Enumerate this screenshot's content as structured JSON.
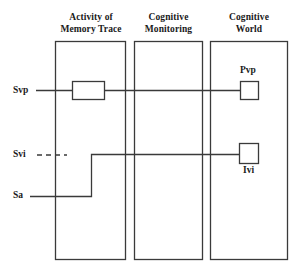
{
  "figure": {
    "background_color": "#ffffff",
    "stroke_color": "#3a3a3a",
    "text_color": "#1a1a1a"
  },
  "columns": [
    {
      "id": "activity-of-memory-trace",
      "title_line1": "Activity of",
      "title_line2": "Memory Trace"
    },
    {
      "id": "cognitive-monitoring",
      "title_line1": "Cognitive",
      "title_line2": "Monitoring"
    },
    {
      "id": "cognitive-world",
      "title_line1": "Cognitive",
      "title_line2": "World"
    }
  ],
  "signals": [
    {
      "id": "svp",
      "label": "Svp",
      "style": "solid"
    },
    {
      "id": "svi",
      "label": "Svi",
      "style": "dashed"
    },
    {
      "id": "sa",
      "label": "Sa",
      "style": "solid"
    }
  ],
  "nodes": [
    {
      "id": "memory-trace-box",
      "label": "",
      "shape": "rectangle"
    },
    {
      "id": "pvp-box",
      "label": "Pvp",
      "shape": "square",
      "label_position": "above"
    },
    {
      "id": "ivi-box",
      "label": "Ivi",
      "shape": "square",
      "label_position": "below"
    }
  ],
  "connections": [
    {
      "id": "svp-to-memory-trace",
      "from": "svp",
      "to": "memory-trace-box"
    },
    {
      "id": "memory-trace-to-pvp",
      "from": "memory-trace-box",
      "to": "pvp-box"
    },
    {
      "id": "sa-to-ivi",
      "from": "sa",
      "to": "ivi-box"
    }
  ]
}
